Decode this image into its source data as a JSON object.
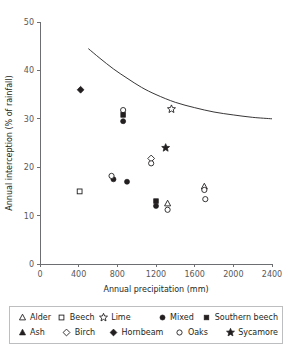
{
  "chart_data": {
    "type": "scatter",
    "title": "",
    "xlabel": "Annual precipitation (mm)",
    "ylabel": "Annual interception (% of rainfall)",
    "xlim": [
      0,
      2400
    ],
    "ylim": [
      0,
      50
    ],
    "xticks": [
      0,
      400,
      800,
      1200,
      1600,
      2000,
      2400
    ],
    "yticks": [
      0,
      10,
      20,
      30,
      40,
      50
    ],
    "grid": false,
    "legend_position": "below-plot",
    "series": [
      {
        "name": "Alder",
        "marker": "open-triangle",
        "points": [
          {
            "x": 1320,
            "y": 12.5
          },
          {
            "x": 1700,
            "y": 16.0
          }
        ]
      },
      {
        "name": "Ash",
        "marker": "filled-triangle",
        "points": []
      },
      {
        "name": "Beech",
        "marker": "open-square",
        "points": [
          {
            "x": 410,
            "y": 15.0
          }
        ]
      },
      {
        "name": "Birch",
        "marker": "open-diamond",
        "points": [
          {
            "x": 1150,
            "y": 21.8
          }
        ]
      },
      {
        "name": "Lime",
        "marker": "open-star",
        "points": [
          {
            "x": 1360,
            "y": 32.0
          }
        ]
      },
      {
        "name": "Hornbeam",
        "marker": "filled-diamond",
        "points": [
          {
            "x": 420,
            "y": 36.0
          }
        ]
      },
      {
        "name": "Mixed",
        "marker": "filled-circle",
        "points": [
          {
            "x": 760,
            "y": 17.5
          },
          {
            "x": 900,
            "y": 17.0
          },
          {
            "x": 860,
            "y": 29.5
          },
          {
            "x": 1200,
            "y": 12.0
          }
        ]
      },
      {
        "name": "Oaks",
        "marker": "open-circle",
        "points": [
          {
            "x": 740,
            "y": 18.2
          },
          {
            "x": 860,
            "y": 31.8
          },
          {
            "x": 1150,
            "y": 20.8
          },
          {
            "x": 1320,
            "y": 11.2
          },
          {
            "x": 1700,
            "y": 15.3
          },
          {
            "x": 1710,
            "y": 13.4
          }
        ]
      },
      {
        "name": "Southern beech",
        "marker": "filled-square",
        "points": [
          {
            "x": 860,
            "y": 30.8
          },
          {
            "x": 1200,
            "y": 13.0
          }
        ]
      },
      {
        "name": "Sycamore",
        "marker": "filled-star",
        "points": [
          {
            "x": 1300,
            "y": 24.0
          }
        ]
      }
    ],
    "trend_line": {
      "name": "fitted curve",
      "points": [
        {
          "x": 500,
          "y": 44.5
        },
        {
          "x": 620,
          "y": 42.5
        },
        {
          "x": 760,
          "y": 40.3
        },
        {
          "x": 900,
          "y": 38.4
        },
        {
          "x": 1050,
          "y": 36.5
        },
        {
          "x": 1200,
          "y": 35.0
        },
        {
          "x": 1400,
          "y": 33.4
        },
        {
          "x": 1600,
          "y": 32.3
        },
        {
          "x": 1800,
          "y": 31.4
        },
        {
          "x": 2000,
          "y": 30.8
        },
        {
          "x": 2200,
          "y": 30.3
        },
        {
          "x": 2400,
          "y": 30.0
        }
      ]
    }
  },
  "legend": {
    "rows": [
      [
        {
          "label": "Alder",
          "marker": "open-triangle"
        },
        {
          "label": "Beech",
          "marker": "open-square"
        },
        {
          "label": "Lime",
          "marker": "open-star"
        },
        {
          "label": "Mixed",
          "marker": "filled-circle"
        },
        {
          "label": "Southern beech",
          "marker": "filled-square"
        }
      ],
      [
        {
          "label": "Ash",
          "marker": "filled-triangle"
        },
        {
          "label": "Birch",
          "marker": "open-diamond"
        },
        {
          "label": "Hornbeam",
          "marker": "filled-diamond"
        },
        {
          "label": "Oaks",
          "marker": "open-circle"
        },
        {
          "label": "Sycamore",
          "marker": "filled-star"
        }
      ]
    ]
  },
  "colors": {
    "marker": "#231f20",
    "axis": "#6d6e71",
    "legend_border": "#bcbec0",
    "background": "#ffffff"
  }
}
